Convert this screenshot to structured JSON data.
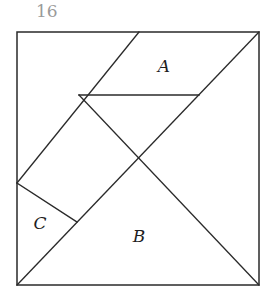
{
  "page": {
    "number": "16"
  },
  "figure": {
    "type": "tangram-square",
    "stroke_color": "#2a2a2a",
    "labels": [
      {
        "id": "A",
        "text": "A",
        "x": 164,
        "y": 66
      },
      {
        "id": "B",
        "text": "B",
        "x": 139,
        "y": 236
      },
      {
        "id": "C",
        "text": "C",
        "x": 40,
        "y": 223
      }
    ]
  }
}
